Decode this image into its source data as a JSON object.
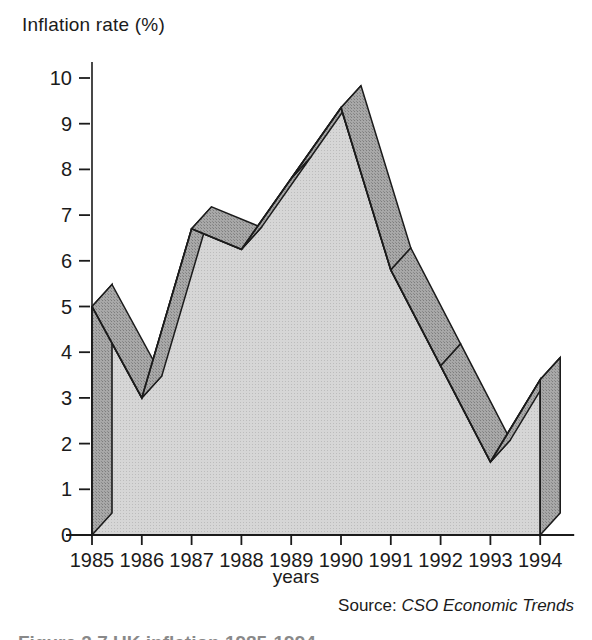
{
  "figure": {
    "ylabel": "Inflation rate (%)",
    "xlabel": "years",
    "source_label": "Source:",
    "source_publication": "CSO Economic Trends",
    "caption": "Figure 2.7  UK inflation 1985-1994",
    "colors": {
      "area_face": "#cfcfcf",
      "ribbon_top": "#9a9a9a",
      "outline": "#1b1b1b",
      "text": "#1b1b1b",
      "background": "#ffffff"
    }
  },
  "chart_data": {
    "type": "area",
    "title": "",
    "xlabel": "years",
    "ylabel": "Inflation rate (%)",
    "categories": [
      "1985",
      "1986",
      "1987",
      "1988",
      "1989",
      "1990",
      "1991",
      "1992",
      "1993",
      "1994"
    ],
    "values": [
      5.0,
      3.0,
      6.7,
      6.25,
      7.8,
      9.35,
      5.8,
      3.7,
      1.6,
      3.4
    ],
    "series": [
      {
        "name": "UK inflation rate",
        "values": [
          5.0,
          3.0,
          6.7,
          6.25,
          7.8,
          9.35,
          5.8,
          3.7,
          1.6,
          3.4
        ]
      }
    ],
    "ylim": [
      0,
      10
    ],
    "yticks": [
      0,
      1,
      2,
      3,
      4,
      5,
      6,
      7,
      8,
      9,
      10
    ],
    "ytick_labels": [
      "0",
      "1",
      "2",
      "3",
      "4",
      "5",
      "6",
      "7",
      "8",
      "9",
      "10"
    ],
    "xtick_labels": [
      "1985",
      "1986",
      "1987",
      "1988",
      "1989",
      "1990",
      "1991",
      "1992",
      "1993",
      "1994"
    ],
    "grid": false,
    "legend": "none",
    "style": "3d-ribbon-area",
    "annotations": [
      "Source: CSO Economic Trends"
    ]
  }
}
